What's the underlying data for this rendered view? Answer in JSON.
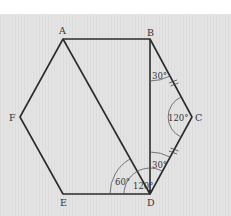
{
  "diagram": {
    "type": "regular hexagon with diagonals",
    "vertices": [
      {
        "label": "A",
        "x": 63,
        "y": 39
      },
      {
        "label": "B",
        "x": 150,
        "y": 39
      },
      {
        "label": "C",
        "x": 192,
        "y": 117
      },
      {
        "label": "D",
        "x": 150,
        "y": 194
      },
      {
        "label": "E",
        "x": 63,
        "y": 194
      },
      {
        "label": "F",
        "x": 20,
        "y": 117
      }
    ],
    "segments": [
      "AB",
      "BC",
      "CD",
      "DE",
      "EF",
      "FA",
      "AD",
      "BD"
    ],
    "congruent_marks": [
      "BC",
      "CD"
    ],
    "angles": [
      {
        "vertex": "B",
        "between": "DBC",
        "label": "30°"
      },
      {
        "vertex": "C",
        "between": "BCD",
        "label": "120°"
      },
      {
        "vertex": "D",
        "between": "BDC",
        "label": "30°"
      },
      {
        "vertex": "D",
        "between": "EDA",
        "label": "60°"
      },
      {
        "vertex": "D",
        "between": "EDB",
        "label": "120°"
      }
    ]
  },
  "labels": {
    "A": "A",
    "B": "B",
    "C": "C",
    "D": "D",
    "E": "E",
    "F": "F",
    "angle_B": "30°",
    "angle_C": "120°",
    "angle_D_top": "30°",
    "angle_D_left": "60°",
    "angle_D_mid": "120°"
  },
  "colors": {
    "background": "#e4e4e4",
    "stroke": "#2b2b2b",
    "text": "#333333"
  }
}
